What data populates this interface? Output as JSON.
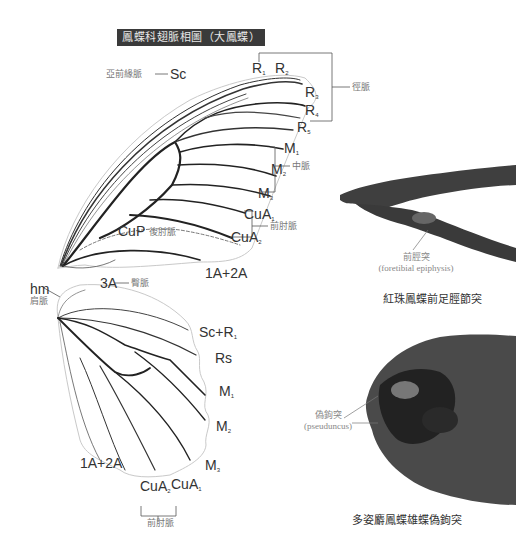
{
  "title": "鳳蝶科翅脈相圖（大鳳蝶）",
  "forewing": {
    "labels": {
      "sc": "Sc",
      "sc_cn": "亞前緣脈",
      "r1": "R",
      "r1_sub": "1",
      "r2": "R",
      "r2_sub": "2",
      "r3": "R",
      "r3_sub": "3",
      "r4": "R",
      "r4_sub": "4",
      "r5": "R",
      "r5_sub": "5",
      "radial_cn": "徑脈",
      "m1": "M",
      "m1_sub": "1",
      "m2": "M",
      "m2_sub": "2",
      "m3": "M",
      "m3_sub": "3",
      "median_cn": "中脈",
      "cua1": "CuA",
      "cua1_sub": "1",
      "cua2": "CuA",
      "cua2_sub": "2",
      "cubital_cn": "前肘脈",
      "cup": "CuP",
      "cup_cn": "後肘脈",
      "a3": "3A",
      "anal_cn": "臀脈",
      "a12": "1A+2A"
    }
  },
  "hindwing": {
    "labels": {
      "hm": "hm",
      "hm_cn": "肩脈",
      "scr1": "Sc+R",
      "scr1_sub": "1",
      "rs": "Rs",
      "m1": "M",
      "m1_sub": "1",
      "m2": "M",
      "m2_sub": "2",
      "m3": "M",
      "m3_sub": "3",
      "a12": "1A+2A",
      "cua2": "CuA",
      "cua2_sub": "2",
      "cua1": "CuA",
      "cua1_sub": "1",
      "cubital_cn": "前肘脈"
    }
  },
  "photo_leg": {
    "annotation_cn": "前脛突",
    "annotation_en": "(foretibial epiphysis)",
    "caption": "紅珠鳳蝶前足脛節突"
  },
  "photo_head": {
    "annotation_cn": "偽鉤突",
    "annotation_en": "(pseuduncus)",
    "caption": "多姿麝鳳蝶雄蝶偽鉤突"
  }
}
